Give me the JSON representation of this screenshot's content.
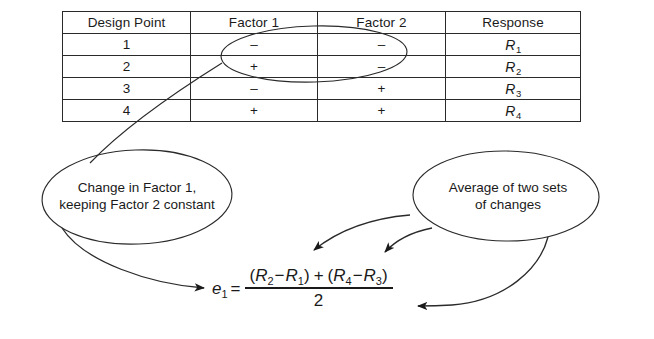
{
  "figure": {
    "type": "doe-effect-diagram",
    "background_color": "#ffffff",
    "line_color": "#2a2a2a"
  },
  "table": {
    "headers": [
      "Design Point",
      "Factor 1",
      "Factor 2",
      "Response"
    ],
    "rows": [
      {
        "design_point": "1",
        "factor1": "–",
        "factor2": "–",
        "response": "R",
        "response_sub": "1"
      },
      {
        "design_point": "2",
        "factor1": "+",
        "factor2": "–",
        "response": "R",
        "response_sub": "2"
      },
      {
        "design_point": "3",
        "factor1": "–",
        "factor2": "+",
        "response": "R",
        "response_sub": "3"
      },
      {
        "design_point": "4",
        "factor1": "+",
        "factor2": "+",
        "response": "R",
        "response_sub": "4"
      }
    ]
  },
  "annotations": {
    "table_highlight_label": "ellipse-around-rows-1-2-factors",
    "bubble_left": "Change in Factor 1,\nkeeping Factor 2 constant",
    "bubble_right": "Average of two sets\nof changes"
  },
  "equation": {
    "lhs_var": "e",
    "lhs_sub": "1",
    "equals": "=",
    "numerator": {
      "open1": "(",
      "t1_var": "R",
      "t1_sub": "2",
      "minus1": "−",
      "t2_var": "R",
      "t2_sub": "1",
      "close1": ")",
      "plus": "+",
      "open2": "(",
      "t3_var": "R",
      "t3_sub": "4",
      "minus2": "−",
      "t4_var": "R",
      "t4_sub": "3",
      "close2": ")"
    },
    "denominator": "2",
    "plain_text": "e1 = [(R2 - R1) + (R4 - R3)] / 2"
  }
}
